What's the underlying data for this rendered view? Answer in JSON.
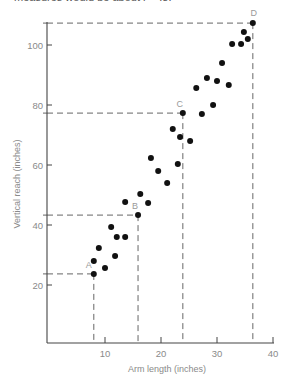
{
  "caption": "measures would be about r = .8.",
  "chart_data": {
    "type": "scatter",
    "title": "",
    "xlabel": "Arm length (inches)",
    "ylabel": "Vertical reach (inches)",
    "xlim": [
      0,
      40
    ],
    "ylim": [
      0,
      108
    ],
    "xticks": [
      10,
      20,
      30,
      40
    ],
    "yticks": [
      20,
      40,
      60,
      80,
      100
    ],
    "grid": false,
    "legend": null,
    "colors": {
      "points": "#111111",
      "axis": "#444444",
      "text": "#8a8a8a",
      "guides": "#555555"
    },
    "points": [
      {
        "x": 8.0,
        "y": 23.7,
        "label": "A"
      },
      {
        "x": 10.0,
        "y": 25.7
      },
      {
        "x": 8.0,
        "y": 28.0
      },
      {
        "x": 11.8,
        "y": 29.7
      },
      {
        "x": 8.9,
        "y": 32.3
      },
      {
        "x": 12.1,
        "y": 36.0
      },
      {
        "x": 13.6,
        "y": 36.0
      },
      {
        "x": 11.1,
        "y": 39.3
      },
      {
        "x": 15.9,
        "y": 43.3,
        "label": "B"
      },
      {
        "x": 13.6,
        "y": 47.7
      },
      {
        "x": 17.7,
        "y": 47.3
      },
      {
        "x": 16.3,
        "y": 50.3
      },
      {
        "x": 21.1,
        "y": 54.0
      },
      {
        "x": 19.5,
        "y": 58.0
      },
      {
        "x": 23.0,
        "y": 60.3
      },
      {
        "x": 18.2,
        "y": 62.3
      },
      {
        "x": 25.2,
        "y": 68.0
      },
      {
        "x": 23.4,
        "y": 69.3
      },
      {
        "x": 22.1,
        "y": 72.0
      },
      {
        "x": 23.9,
        "y": 77.3,
        "label": "C"
      },
      {
        "x": 27.3,
        "y": 77.0
      },
      {
        "x": 29.3,
        "y": 80.0
      },
      {
        "x": 26.3,
        "y": 85.7
      },
      {
        "x": 32.1,
        "y": 86.7
      },
      {
        "x": 30.0,
        "y": 88.0
      },
      {
        "x": 28.2,
        "y": 89.0
      },
      {
        "x": 30.9,
        "y": 94.0
      },
      {
        "x": 32.7,
        "y": 100.3
      },
      {
        "x": 34.3,
        "y": 100.3
      },
      {
        "x": 35.5,
        "y": 102.0
      },
      {
        "x": 34.8,
        "y": 104.3
      },
      {
        "x": 36.4,
        "y": 107.3,
        "label": "D"
      }
    ],
    "annotations": [
      {
        "label": "A",
        "x": 8.0,
        "y": 23.7,
        "dashed_guides": true
      },
      {
        "label": "B",
        "x": 15.9,
        "y": 43.3,
        "dashed_guides": true
      },
      {
        "label": "C",
        "x": 23.9,
        "y": 77.3,
        "dashed_guides": true
      },
      {
        "label": "D",
        "x": 36.4,
        "y": 107.3,
        "dashed_guides": true
      }
    ]
  }
}
